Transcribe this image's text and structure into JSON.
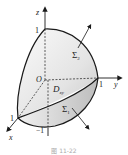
{
  "figure": {
    "caption": "图 11-22",
    "labels": {
      "z_axis": "z",
      "y_axis": "y",
      "x_axis": "x",
      "origin": "O",
      "z_one": "1",
      "y_one": "1",
      "x_one": "1",
      "z_minus_one": "−1",
      "region": "D",
      "region_sub": "xy",
      "surface_upper": "Σ",
      "surface_upper_sub": "2",
      "surface_lower": "Σ",
      "surface_lower_sub": "1"
    },
    "colors": {
      "stroke": "#1a1a1a",
      "shade_light": "#f2f2f2",
      "shade_mid": "#d9d9d9",
      "shade_dark": "#bfbfbf"
    }
  }
}
